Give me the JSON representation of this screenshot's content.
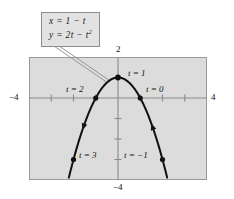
{
  "figure": {
    "equation_box": {
      "line1": "x = 1 − t",
      "line2_prefix": "y = 2t − t",
      "line2_exponent": "2"
    },
    "axis_labels": {
      "left": "−4",
      "right": "4",
      "top": "2",
      "bottom": "−4"
    },
    "point_labels": {
      "t3": "t = 3",
      "t2": "t = 2",
      "t1": "t = 1",
      "t0": "t = 0",
      "tm1": "t = −1"
    },
    "colors": {
      "panel_fill": "#dcdcdc",
      "panel_border": "#9a9a9a",
      "axis": "#8a8a8a",
      "curve": "#000000",
      "box_fill": "#e2e2e2",
      "box_border": "#8c8c8c"
    }
  },
  "chart_data": {
    "type": "line",
    "title": "",
    "subtitle": "",
    "xlabel": "",
    "ylabel": "",
    "xlim": [
      -4,
      4
    ],
    "ylim": [
      -4,
      2
    ],
    "grid": false,
    "legend": "none",
    "parametric": {
      "x_equation": "x = 1 - t",
      "y_equation": "y = 2t - t^2",
      "t_range": [
        -1.6,
        3.6
      ],
      "orientation": "increasing t moves right-to-left along the curve"
    },
    "xticks": [
      -3,
      -2,
      -1,
      1,
      2,
      3
    ],
    "yticks": [
      -3,
      -2,
      -1,
      1
    ],
    "xtick_labels_shown": [
      "-4",
      "4"
    ],
    "ytick_labels_shown": [
      "2",
      "-4"
    ],
    "series": [
      {
        "name": "x = 1 - t, y = 2t - t^2",
        "points": [
          {
            "t": -1.6,
            "x": 2.6,
            "y": -5.76
          },
          {
            "t": -1,
            "x": 2,
            "y": -3
          },
          {
            "t": -0.5,
            "x": 1.5,
            "y": -1.25
          },
          {
            "t": 0,
            "x": 1,
            "y": 0
          },
          {
            "t": 0.5,
            "x": 0.5,
            "y": 0.75
          },
          {
            "t": 1,
            "x": 0,
            "y": 1
          },
          {
            "t": 1.5,
            "x": -0.5,
            "y": 0.75
          },
          {
            "t": 2,
            "x": -1,
            "y": 0
          },
          {
            "t": 2.5,
            "x": -1.5,
            "y": -1.25
          },
          {
            "t": 3,
            "x": -2,
            "y": -3
          },
          {
            "t": 3.6,
            "x": -2.6,
            "y": -5.76
          }
        ]
      }
    ],
    "marked_points": [
      {
        "t": 3,
        "x": -2,
        "y": -3,
        "label": "t = 3"
      },
      {
        "t": 2,
        "x": -1,
        "y": 0,
        "label": "t = 2"
      },
      {
        "t": 1,
        "x": 0,
        "y": 1,
        "label": "t = 1"
      },
      {
        "t": 0,
        "x": 1,
        "y": 0,
        "label": "t = 0"
      },
      {
        "t": -1,
        "x": 2,
        "y": -3,
        "label": "t = -1"
      }
    ],
    "arrows": [
      {
        "at_t": 2.55,
        "direction": "toward increasing t (down-left branch)"
      },
      {
        "at_t": -0.55,
        "direction": "toward increasing t (up from lower-right branch)"
      }
    ],
    "annotations": [
      {
        "text": "x = 1 - t",
        "type": "callout"
      },
      {
        "text": "y = 2t - t^2",
        "type": "callout"
      }
    ]
  }
}
